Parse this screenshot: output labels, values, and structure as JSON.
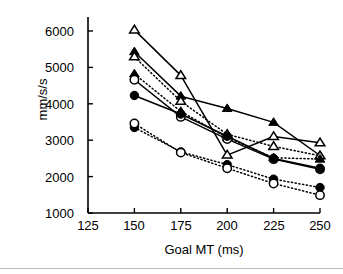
{
  "chart_data": {
    "type": "line",
    "title": "",
    "subtitle": "",
    "xlabel": "Goal MT (ms)",
    "ylabel": "mm/s/s",
    "x": [
      150,
      175,
      200,
      225,
      250
    ],
    "xticks": [
      125,
      150,
      175,
      200,
      225,
      250
    ],
    "yticks": [
      1000,
      2000,
      3000,
      4000,
      5000,
      6000
    ],
    "xlim": [
      125,
      250
    ],
    "ylim": [
      1000,
      6300
    ],
    "grid": false,
    "legend": "none",
    "series": [
      {
        "name": "open-triangle-solid",
        "marker": "open-triangle",
        "line": "solid",
        "values": [
          6030,
          4780,
          2590,
          3100,
          2930
        ]
      },
      {
        "name": "filled-triangle-solid",
        "marker": "filled-triangle",
        "line": "solid",
        "values": [
          5430,
          4210,
          3870,
          3490,
          2580
        ]
      },
      {
        "name": "open-triangle-dotted",
        "marker": "open-triangle",
        "line": "dotted",
        "values": [
          5290,
          4070,
          3160,
          2830,
          2570
        ]
      },
      {
        "name": "filled-triangle-dotted",
        "marker": "filled-triangle",
        "line": "dotted",
        "values": [
          4820,
          3790,
          3070,
          2520,
          2480
        ]
      },
      {
        "name": "open-circle-solid",
        "marker": "open-circle",
        "line": "solid",
        "values": [
          4660,
          3640,
          3030,
          2480,
          2200
        ]
      },
      {
        "name": "filled-circle-solid",
        "marker": "filled-circle",
        "line": "solid",
        "values": [
          4230,
          3720,
          3110,
          2500,
          2230
        ]
      },
      {
        "name": "filled-circle-dotted",
        "marker": "filled-circle",
        "line": "dotted",
        "values": [
          3350,
          2680,
          2330,
          1930,
          1700
        ]
      },
      {
        "name": "open-circle-dotted",
        "marker": "open-circle",
        "line": "dotted",
        "values": [
          3460,
          2660,
          2230,
          1810,
          1490
        ]
      }
    ]
  },
  "axes": {
    "y_label": "mm/s/s",
    "x_label": "Goal MT (ms)",
    "y_tick_labels": [
      "6000",
      "5000",
      "4000",
      "3000",
      "2000",
      "1000"
    ],
    "x_tick_labels": [
      "125",
      "150",
      "175",
      "200",
      "225",
      "250"
    ]
  },
  "style": {
    "ink": "#000000",
    "background": "#ffffff",
    "rule": "#b9b9b9"
  }
}
